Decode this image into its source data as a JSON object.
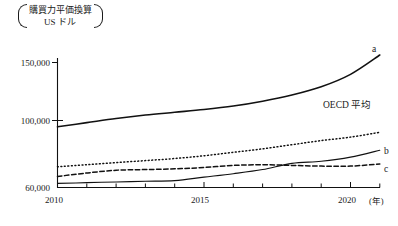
{
  "chart_data": {
    "type": "line",
    "title": "",
    "subtitle": "",
    "ylabel_lines": [
      "購買力平価換算",
      "US ドル"
    ],
    "ylabel": "購買力平価換算 US ドル",
    "xlabel": "(年)",
    "grid": false,
    "legend_position": "inline-right",
    "xlim": [
      2010,
      2021
    ],
    "ylim": [
      60000,
      160000
    ],
    "x": [
      2010,
      2011,
      2012,
      2013,
      2014,
      2015,
      2016,
      2017,
      2018,
      2019,
      2020,
      2021
    ],
    "xtick_values": [
      2010,
      2011,
      2012,
      2013,
      2014,
      2015,
      2016,
      2017,
      2018,
      2019,
      2020,
      2021
    ],
    "xtick_labels": [
      "2010",
      "",
      "",
      "",
      "",
      "2015",
      "",
      "",
      "",
      "",
      "2020",
      ""
    ],
    "xtick_labels_shown": [
      "2010",
      "2015",
      "2020"
    ],
    "ytick_values": [
      60000,
      100000,
      150000
    ],
    "ytick_labels": [
      "60,000",
      "100,000",
      "150,000"
    ],
    "series": [
      {
        "name": "a",
        "label": "a",
        "style": "solid",
        "values": [
          104000,
          107000,
          110000,
          112500,
          114500,
          116500,
          119000,
          122500,
          127000,
          133000,
          142000,
          156000
        ]
      },
      {
        "name": "OECD 平均",
        "label": "OECD 平均",
        "style": "dotted",
        "values": [
          75000,
          76500,
          78000,
          79500,
          81000,
          83000,
          85500,
          88000,
          91000,
          94000,
          96500,
          100000
        ]
      },
      {
        "name": "b",
        "label": "b",
        "style": "solid",
        "values": [
          63000,
          63500,
          64000,
          64500,
          65000,
          67500,
          70000,
          73000,
          77500,
          79000,
          82000,
          87000
        ]
      },
      {
        "name": "c",
        "label": "c",
        "style": "dashed",
        "values": [
          68000,
          70500,
          72500,
          73000,
          73500,
          74500,
          76000,
          76500,
          76000,
          75500,
          75500,
          77000
        ]
      }
    ]
  },
  "labels": {
    "ylabel_line1": "購買力平価換算",
    "ylabel_line2": "US ドル",
    "ytick_150000": "150,000",
    "ytick_100000": "100,000",
    "ytick_60000": "60,000",
    "xtick_2010": "2010",
    "xtick_2015": "2015",
    "xtick_2020": "2020",
    "x_unit": "(年)",
    "series_a": "a",
    "series_oecd": "OECD 平均",
    "series_b": "b",
    "series_c": "c"
  },
  "colors": {
    "line": "#111111",
    "text": "#1a1a1a",
    "background": "#ffffff"
  }
}
